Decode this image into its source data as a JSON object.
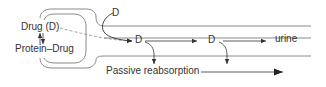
{
  "diagram": {
    "type": "renal-excretion-schematic",
    "colors": {
      "line": "#8a8a8a",
      "arrow": "#333333",
      "text": "#333333",
      "dashed": "#9a9a9a"
    },
    "labels": {
      "drug": "Drug (D)",
      "protein_drug": "Protein–Drug",
      "filtered_d": "D",
      "tubule_d1": "D",
      "tubule_d2": "D",
      "urine": "urine",
      "reabsorption": "Passive reabsorption"
    },
    "structures": [
      "glomerulus-capsule",
      "renal-tubule"
    ],
    "arrows": [
      {
        "from": "drug",
        "to": "protein_drug",
        "style": "reversible"
      },
      {
        "from": "drug",
        "to": "tubule_d1",
        "style": "dashed",
        "meaning": "glomerular filtration"
      },
      {
        "from": "filtered_d",
        "to": "tubule_d1",
        "style": "solid",
        "meaning": "secretion"
      },
      {
        "from": "tubule_d1",
        "to": "tubule_d2",
        "style": "solid"
      },
      {
        "from": "tubule_d2",
        "to": "urine",
        "style": "solid"
      },
      {
        "from": "tubule_d1",
        "to": "reabsorption",
        "style": "solid"
      },
      {
        "from": "tubule_d2",
        "to": "reabsorption",
        "style": "solid"
      },
      {
        "from": "reabsorption",
        "to": "right",
        "style": "solid-bold"
      }
    ]
  }
}
